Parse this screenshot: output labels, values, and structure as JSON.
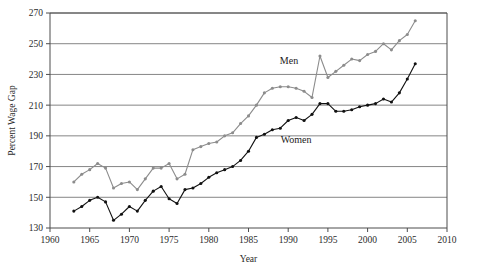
{
  "chart_data": {
    "type": "line",
    "title": "",
    "xlabel": "Year",
    "ylabel": "Percent Wage Gap",
    "xlim": [
      1960,
      2010
    ],
    "ylim": [
      130,
      270
    ],
    "xticks": [
      1960,
      1965,
      1970,
      1975,
      1980,
      1985,
      1990,
      1995,
      2000,
      2005,
      2010
    ],
    "yticks": [
      130,
      150,
      170,
      190,
      210,
      230,
      250,
      270
    ],
    "grid": "horizontal",
    "legend_position": "inline-annotations",
    "markers": true,
    "series": [
      {
        "name": "Men",
        "color": "#8c8c8c",
        "label_x": 1990.1,
        "label_y": 236.5,
        "x": [
          1963,
          1964,
          1965,
          1966,
          1967,
          1968,
          1969,
          1970,
          1971,
          1972,
          1973,
          1974,
          1975,
          1976,
          1977,
          1978,
          1979,
          1980,
          1981,
          1982,
          1983,
          1984,
          1985,
          1986,
          1987,
          1988,
          1989,
          1990,
          1991,
          1992,
          1993,
          1994,
          1995,
          1996,
          1997,
          1998,
          1999,
          2000,
          2001,
          2002,
          2003,
          2004,
          2005,
          2006
        ],
        "values": [
          160,
          165,
          168,
          172,
          169,
          156,
          159,
          160,
          155,
          162,
          169,
          169,
          172,
          162,
          165,
          181,
          183,
          185,
          186,
          190,
          192,
          198,
          203,
          210,
          218,
          221,
          222,
          222,
          221,
          219,
          215,
          242,
          228,
          232,
          236,
          240,
          239,
          243,
          245,
          250,
          246,
          252,
          256,
          265
        ]
      },
      {
        "name": "Women",
        "color": "#111111",
        "label_x": 1991.0,
        "label_y": 185.5,
        "x": [
          1963,
          1964,
          1965,
          1966,
          1967,
          1968,
          1969,
          1970,
          1971,
          1972,
          1973,
          1974,
          1975,
          1976,
          1977,
          1978,
          1979,
          1980,
          1981,
          1982,
          1983,
          1984,
          1985,
          1986,
          1987,
          1988,
          1989,
          1990,
          1991,
          1992,
          1993,
          1994,
          1995,
          1996,
          1997,
          1998,
          1999,
          2000,
          2001,
          2002,
          2003,
          2004,
          2005,
          2006
        ],
        "values": [
          141,
          144,
          148,
          150,
          147,
          135,
          139,
          144,
          141,
          148,
          154,
          157,
          149,
          146,
          155,
          156,
          159,
          163,
          166,
          168,
          170,
          174,
          180,
          189,
          191,
          194,
          195,
          200,
          202,
          200,
          204,
          211,
          211,
          206,
          206,
          207,
          209,
          210,
          211,
          214,
          212,
          218,
          227,
          237
        ]
      }
    ]
  }
}
